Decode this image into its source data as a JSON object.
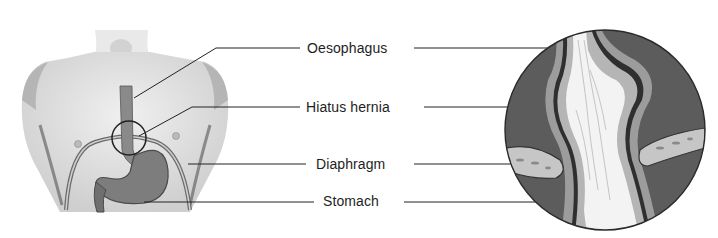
{
  "diagram": {
    "labels": [
      {
        "id": "oesophagus",
        "text": "Oesophagus",
        "x": 307,
        "y": 35
      },
      {
        "id": "hiatus-hernia",
        "text": "Hiatus hernia",
        "x": 306,
        "y": 93
      },
      {
        "id": "diaphragm",
        "text": "Diaphragm",
        "x": 316,
        "y": 150
      },
      {
        "id": "stomach",
        "text": "Stomach",
        "x": 323,
        "y": 189
      }
    ],
    "panels": {
      "left": "Torso outline showing oesophagus, diaphragm and stomach with circled hernia region",
      "right": "Magnified circular inset of hiatus hernia through diaphragm"
    },
    "colors": {
      "ink": "#1e1e1e",
      "shade_dark": "#4a4a4a",
      "shade_mid": "#7a7a7a",
      "shade_light": "#bdbdbd",
      "skin": "#e6e6e6",
      "background": "#ffffff"
    }
  }
}
